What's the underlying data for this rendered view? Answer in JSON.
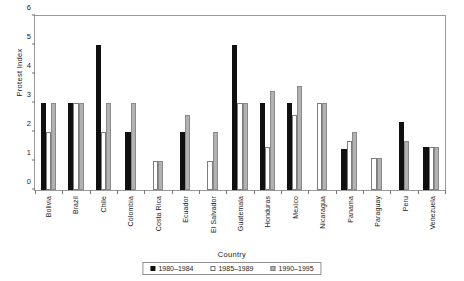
{
  "chart_data": {
    "type": "bar",
    "title": "",
    "xlabel": "Country",
    "ylabel": "Protest Index",
    "ylim": [
      0,
      6
    ],
    "yticks": [
      0,
      1,
      2,
      3,
      4,
      5,
      6
    ],
    "grid": false,
    "legend_position": "bottom",
    "categories": [
      "Bolivia",
      "Brazil",
      "Chile",
      "Colombia",
      "Costa Rica",
      "Ecuador",
      "El Salvador",
      "Guatemala",
      "Honduras",
      "Mexico",
      "Nicaragua",
      "Panama",
      "Paraguay",
      "Peru",
      "Venezuela"
    ],
    "series": [
      {
        "name": "1980–1984",
        "color": "#101010",
        "values": [
          3,
          3,
          5,
          2,
          0,
          2,
          0,
          5,
          3,
          3,
          0,
          1.4,
          0,
          2.35,
          1.5
        ]
      },
      {
        "name": "1985–1989",
        "color": "#ffffff",
        "values": [
          2,
          3,
          2,
          0,
          1,
          0,
          1,
          3,
          1.5,
          2.6,
          3,
          1.7,
          1.1,
          0,
          1.5
        ]
      },
      {
        "name": "1990–1995",
        "color": "#b2b2b2",
        "values": [
          3,
          3,
          3,
          3,
          1,
          2.6,
          2,
          3,
          3.4,
          3.6,
          3,
          2,
          1.1,
          1.7,
          1.5
        ]
      }
    ]
  }
}
